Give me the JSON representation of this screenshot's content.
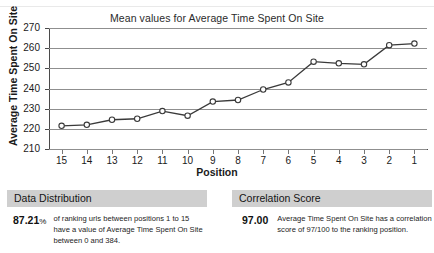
{
  "chart_data": {
    "type": "line",
    "title": "Mean values for Average Time Spent On Site",
    "xlabel": "Position",
    "ylabel": "Average Time Spent On Site",
    "categories": [
      "15",
      "14",
      "13",
      "12",
      "11",
      "10",
      "9",
      "8",
      "7",
      "6",
      "5",
      "4",
      "3",
      "2",
      "1"
    ],
    "values": [
      221.5,
      222.0,
      224.5,
      225.0,
      228.8,
      226.5,
      233.5,
      234.3,
      239.5,
      243.0,
      253.3,
      252.5,
      252.0,
      261.5,
      262.3
    ],
    "ylim": [
      210,
      270
    ],
    "yticks": [
      "270",
      "260",
      "250",
      "240",
      "230",
      "220",
      "210"
    ],
    "grid": true,
    "legend": "none",
    "series_color": "#3a3a3a",
    "marker": "open-circle"
  },
  "panels": [
    {
      "id": "data-distribution",
      "header": "Data Distribution",
      "figure": "87.21",
      "figure_suffix": "%",
      "text": "of ranking urls between positions 1 to 15 have a value of Average Time Spent On Site between 0 and 384."
    },
    {
      "id": "correlation-score",
      "header": "Correlation Score",
      "figure": "97.00",
      "figure_suffix": "",
      "text": "Average Time Spent On Site has a correlation score of 97/100 to the ranking position."
    }
  ],
  "colors": {
    "grid": "#8f8f8f",
    "axis": "#4a4a4a",
    "panel_header_bg": "#cfcfcf",
    "line": "#3a3a3a"
  }
}
